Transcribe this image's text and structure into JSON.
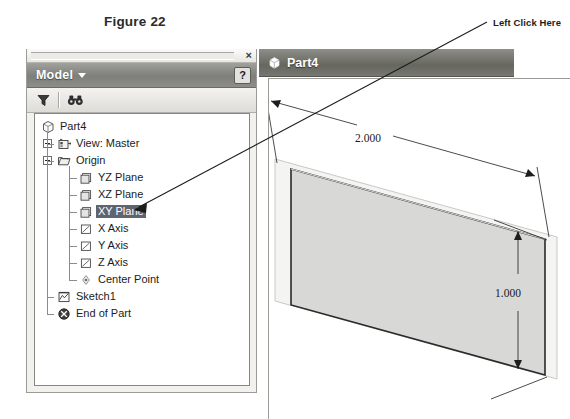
{
  "figure": {
    "caption": "Figure 22"
  },
  "callout": {
    "label": "Left Click Here",
    "target": "xy-plane-tree-item"
  },
  "model_panel": {
    "title": "Model",
    "title_caret": "dropdown-caret",
    "close_label": "×",
    "help_label": "?",
    "toolbar": [
      {
        "name": "filter-icon",
        "tooltip": "Filter"
      },
      {
        "name": "find-icon",
        "tooltip": "Find"
      }
    ],
    "tree": [
      {
        "label": "Part4",
        "level": 0,
        "icon": "part-cube-icon",
        "expander": "none",
        "selected": false
      },
      {
        "label": "View: Master",
        "level": 1,
        "icon": "view-icon",
        "expander": "plus",
        "selected": false
      },
      {
        "label": "Origin",
        "level": 1,
        "icon": "folder-icon",
        "expander": "minus",
        "selected": false
      },
      {
        "label": "YZ Plane",
        "level": 2,
        "icon": "plane-icon",
        "expander": "none",
        "selected": false
      },
      {
        "label": "XZ Plane",
        "level": 2,
        "icon": "plane-icon",
        "expander": "none",
        "selected": false
      },
      {
        "label": "XY Plane",
        "level": 2,
        "icon": "plane-icon",
        "expander": "none",
        "selected": true
      },
      {
        "label": "X Axis",
        "level": 2,
        "icon": "axis-icon",
        "expander": "none",
        "selected": false
      },
      {
        "label": "Y Axis",
        "level": 2,
        "icon": "axis-icon",
        "expander": "none",
        "selected": false
      },
      {
        "label": "Z Axis",
        "level": 2,
        "icon": "axis-icon",
        "expander": "none",
        "selected": false
      },
      {
        "label": "Center Point",
        "level": 2,
        "icon": "center-point-icon",
        "expander": "none",
        "selected": false
      },
      {
        "label": "Sketch1",
        "level": 1,
        "icon": "sketch-icon",
        "expander": "none",
        "selected": false
      },
      {
        "label": "End of Part",
        "level": 1,
        "icon": "end-of-part-icon",
        "expander": "none",
        "selected": false
      }
    ]
  },
  "document_window": {
    "tab_title": "Part4",
    "tab_icon": "part-cube-icon",
    "dimensions": [
      {
        "name": "width-dimension",
        "value": "2.000"
      },
      {
        "name": "height-dimension",
        "value": "1.000"
      }
    ]
  },
  "colors": {
    "panel_title_bar": "#7e7e7a",
    "doc_title_bar": "#67675f",
    "selection_highlight": "#5e6470",
    "plane_fill": "#d8d8d6",
    "canvas_background": "#ffffff"
  }
}
